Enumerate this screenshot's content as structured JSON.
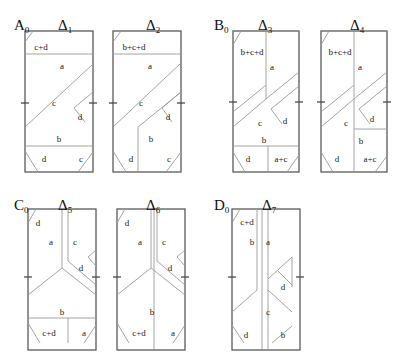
{
  "figure": {
    "width": 399,
    "height": 361,
    "background": "#ffffff",
    "line_color": "#9a9a9a",
    "border_color": "#5a5a5a",
    "text_color": "#1a1a1a"
  },
  "groups": [
    {
      "id": "A",
      "group_label": "A",
      "group_sub": "0",
      "group_label_x": 14,
      "group_label_y": 18,
      "panels": [
        {
          "id": "delta1",
          "title": "Δ",
          "title_sub": "1",
          "title_x": 58,
          "title_y": 18,
          "rect": {
            "x": 25,
            "y": 31,
            "w": 68,
            "h": 141
          },
          "cells": [
            {
              "label": "c+d",
              "x": 41,
              "y": 48
            },
            {
              "label": "a",
              "x": 62,
              "y": 67
            },
            {
              "label": "c",
              "x": 54,
              "y": 104
            },
            {
              "label": "d",
              "x": 80,
              "y": 118
            },
            {
              "label": "b",
              "x": 59,
              "y": 140
            },
            {
              "label": "d",
              "x": 44,
              "y": 160
            },
            {
              "label": "c",
              "x": 81,
              "y": 160
            }
          ]
        },
        {
          "id": "delta2",
          "title": "Δ",
          "title_sub": "2",
          "title_x": 146,
          "title_y": 18,
          "rect": {
            "x": 113,
            "y": 31,
            "w": 68,
            "h": 141
          },
          "cells": [
            {
              "label": "b+c+d",
              "x": 134,
              "y": 48
            },
            {
              "label": "a",
              "x": 150,
              "y": 67
            },
            {
              "label": "c",
              "x": 141,
              "y": 104
            },
            {
              "label": "d",
              "x": 168,
              "y": 118
            },
            {
              "label": "b",
              "x": 151,
              "y": 140
            },
            {
              "label": "d",
              "x": 131,
              "y": 160
            },
            {
              "label": "c",
              "x": 169,
              "y": 160
            }
          ]
        }
      ]
    },
    {
      "id": "B",
      "group_label": "B",
      "group_sub": "0",
      "group_label_x": 214,
      "group_label_y": 18,
      "panels": [
        {
          "id": "delta3",
          "title": "Δ",
          "title_sub": "3",
          "title_x": 258,
          "title_y": 18,
          "rect": {
            "x": 233,
            "y": 31,
            "w": 66,
            "h": 141
          },
          "cells": [
            {
              "label": "b+c+d",
              "x": 252,
              "y": 53
            },
            {
              "label": "a",
              "x": 272,
              "y": 68
            },
            {
              "label": "c",
              "x": 260,
              "y": 124
            },
            {
              "label": "d",
              "x": 285,
              "y": 122
            },
            {
              "label": "b",
              "x": 264,
              "y": 141
            },
            {
              "label": "d",
              "x": 248,
              "y": 160
            },
            {
              "label": "a+c",
              "x": 281,
              "y": 160
            }
          ]
        },
        {
          "id": "delta4",
          "title": "Δ",
          "title_sub": "4",
          "title_x": 350,
          "title_y": 18,
          "rect": {
            "x": 321,
            "y": 31,
            "w": 66,
            "h": 141
          },
          "cells": [
            {
              "label": "b+c+d",
              "x": 340,
              "y": 53
            },
            {
              "label": "a",
              "x": 360,
              "y": 68
            },
            {
              "label": "c",
              "x": 346,
              "y": 124
            },
            {
              "label": "d",
              "x": 372,
              "y": 120
            },
            {
              "label": "b",
              "x": 361,
              "y": 142
            },
            {
              "label": "d",
              "x": 337,
              "y": 160
            },
            {
              "label": "a+c",
              "x": 370,
              "y": 160
            }
          ]
        }
      ]
    },
    {
      "id": "C",
      "group_label": "C",
      "group_sub": "0",
      "group_label_x": 14,
      "group_label_y": 198,
      "panels": [
        {
          "id": "delta5",
          "title": "Δ",
          "title_sub": "5",
          "title_x": 58,
          "title_y": 198,
          "rect": {
            "x": 28,
            "y": 209,
            "w": 68,
            "h": 141
          },
          "cells": [
            {
              "label": "d",
              "x": 38,
              "y": 224
            },
            {
              "label": "a",
              "x": 51,
              "y": 243
            },
            {
              "label": "c",
              "x": 75,
              "y": 243
            },
            {
              "label": "d",
              "x": 81,
              "y": 269
            },
            {
              "label": "b",
              "x": 62,
              "y": 313
            },
            {
              "label": "c+d",
              "x": 49,
              "y": 334
            },
            {
              "label": "a",
              "x": 84,
              "y": 334
            }
          ]
        },
        {
          "id": "delta6",
          "title": "Δ",
          "title_sub": "6",
          "title_x": 146,
          "title_y": 198,
          "rect": {
            "x": 117,
            "y": 209,
            "w": 68,
            "h": 141
          },
          "cells": [
            {
              "label": "d",
              "x": 127,
              "y": 224
            },
            {
              "label": "a",
              "x": 140,
              "y": 243
            },
            {
              "label": "c",
              "x": 164,
              "y": 243
            },
            {
              "label": "d",
              "x": 170,
              "y": 269
            },
            {
              "label": "b",
              "x": 152,
              "y": 313
            },
            {
              "label": "c+d",
              "x": 139,
              "y": 334
            },
            {
              "label": "a",
              "x": 173,
              "y": 334
            }
          ]
        }
      ]
    },
    {
      "id": "D",
      "group_label": "D",
      "group_sub": "0",
      "group_label_x": 214,
      "group_label_y": 198,
      "panels": [
        {
          "id": "delta7",
          "title": "Δ",
          "title_sub": "7",
          "title_x": 262,
          "title_y": 198,
          "rect": {
            "x": 232,
            "y": 209,
            "w": 68,
            "h": 141
          },
          "cells": [
            {
              "label": "c+d",
              "x": 247,
              "y": 223
            },
            {
              "label": "b",
              "x": 252,
              "y": 243
            },
            {
              "label": "a",
              "x": 268,
              "y": 243
            },
            {
              "label": "d",
              "x": 283,
              "y": 288
            },
            {
              "label": "c",
              "x": 268,
              "y": 313
            },
            {
              "label": "d",
              "x": 246,
              "y": 336
            },
            {
              "label": "b",
              "x": 283,
              "y": 336
            }
          ]
        }
      ]
    }
  ],
  "panel_paths": {
    "delta1": [
      "M25,54 L93,54",
      "M25,146 L93,146",
      "M33,31 L25,42",
      "M25,127 L93,64",
      "M74,108 L93,92",
      "M74,108 L85,122",
      "M25,151 L38,172",
      "M78,172 L93,152"
    ],
    "delta2": [
      "M113,54 L181,54",
      "M113,127 L181,63",
      "M121,31 L113,42",
      "M138,127 L138,172",
      "M138,127 L181,92",
      "M162,108 L181,92",
      "M162,108 L172,122",
      "M113,151 L126,172",
      "M166,172 L181,152"
    ],
    "delta3": [
      "M233,146 L299,146",
      "M241,31 L233,45",
      "M266,31 L266,99",
      "M266,99 L233,127",
      "M233,112 L266,85",
      "M266,99 L299,72",
      "M271,109 L299,86",
      "M271,109 L282,124",
      "M233,152 L245,172",
      "M268,146 L268,172",
      "M287,172 L299,155"
    ],
    "delta4": [
      "M329,31 L321,45",
      "M354,31 L354,172",
      "M354,99 L321,127",
      "M321,112 L354,85",
      "M354,99 L387,72",
      "M359,109 L387,86",
      "M359,109 L370,124",
      "M321,152 L333,172",
      "M354,129 L387,129",
      "M375,172 L387,156"
    ],
    "delta5": [
      "M28,318 L96,318",
      "M36,209 L28,223",
      "M62,209 L62,268",
      "M62,268 L28,295",
      "M68,209 L68,261",
      "M68,261 L96,285",
      "M88,257 L96,250",
      "M88,257 L96,266",
      "M62,268 L96,295",
      "M28,323 L40,343",
      "M68,343 L68,318",
      "M84,343 L96,325"
    ],
    "delta6": [
      "M125,209 L117,223",
      "M151,209 L151,268",
      "M151,268 L117,295",
      "M157,209 L157,261",
      "M157,261 L185,285",
      "M177,257 L185,250",
      "M177,257 L185,266",
      "M151,268 L185,295",
      "M117,323 L129,343",
      "M154,209 L154,350",
      "M173,343 L185,325"
    ],
    "delta7": [
      "M240,209 L232,223",
      "M262,209 L262,350",
      "M257,209 L257,290",
      "M257,290 L232,312",
      "M268,209 L268,350",
      "M292,257 L268,279",
      "M292,257 L292,287",
      "M278,271 L292,285",
      "M268,290 L292,312",
      "M232,325 L244,343",
      "M272,343 L292,326"
    ]
  },
  "ticks": {
    "delta1": [
      "M21,103 L29,103",
      "M89,103 L97,103"
    ],
    "delta2": [
      "M109,103 L117,103",
      "M177,103 L185,103"
    ],
    "delta3": [
      "M229,102 L237,102",
      "M295,102 L303,102"
    ],
    "delta4": [
      "M317,102 L325,102",
      "M383,102 L391,102"
    ],
    "delta5": [
      "M24,277 L32,277",
      "M92,277 L100,277"
    ],
    "delta6": [
      "M113,277 L121,277",
      "M181,277 L189,277"
    ],
    "delta7": [
      "M228,277 L236,277",
      "M296,277 L304,277"
    ]
  }
}
